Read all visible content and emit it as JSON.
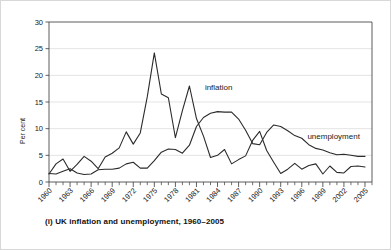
{
  "caption": "(i) UK inflation and unemployment, 1960–2005",
  "colors": {
    "line": "#2b2b2b",
    "grid": "#d9d9d9",
    "frame": "#4a4a4a",
    "text": "#1a1a1a",
    "background": "#ffffff"
  },
  "chart_data": {
    "type": "line",
    "title": "(i) UK inflation and unemployment, 1960–2005",
    "xlabel": "",
    "ylabel": "Per cent",
    "xlim": [
      1960,
      2006
    ],
    "ylim": [
      0,
      30
    ],
    "ytick_labels": [
      "0",
      "5",
      "10",
      "15",
      "20",
      "25",
      "30"
    ],
    "yticks": [
      0,
      5,
      10,
      15,
      20,
      25,
      30
    ],
    "xtick_labels": [
      "1960",
      "1963",
      "1966",
      "1969",
      "1972",
      "1975",
      "1978",
      "1981",
      "1984",
      "1987",
      "1990",
      "1993",
      "1996",
      "1999",
      "2002",
      "2005"
    ],
    "xticks": [
      1960,
      1963,
      1966,
      1969,
      1972,
      1975,
      1978,
      1981,
      1984,
      1987,
      1990,
      1993,
      1996,
      1999,
      2002,
      2005
    ],
    "xtick_minor_step": 1,
    "grid": "horizontal",
    "legend": "inline-annotations",
    "annotations": [
      {
        "text": "inflation",
        "x": 1982.2,
        "y": 17.2
      },
      {
        "text": "unemployment",
        "x": 1996.8,
        "y": 8.0
      }
    ],
    "x": [
      1960,
      1961,
      1962,
      1963,
      1964,
      1965,
      1966,
      1967,
      1968,
      1969,
      1970,
      1971,
      1972,
      1973,
      1974,
      1975,
      1976,
      1977,
      1978,
      1979,
      1980,
      1981,
      1982,
      1983,
      1984,
      1985,
      1986,
      1987,
      1988,
      1989,
      1990,
      1991,
      1992,
      1993,
      1994,
      1995,
      1996,
      1997,
      1998,
      1999,
      2000,
      2001,
      2002,
      2003,
      2004,
      2005
    ],
    "series": [
      {
        "name": "inflation",
        "values": [
          1.5,
          3.4,
          4.3,
          2.0,
          3.3,
          4.8,
          3.9,
          2.5,
          4.7,
          5.4,
          6.4,
          9.4,
          7.1,
          9.2,
          16.0,
          24.2,
          16.5,
          15.8,
          8.3,
          13.4,
          18.0,
          11.9,
          8.6,
          4.6,
          5.0,
          6.1,
          3.4,
          4.2,
          4.9,
          7.8,
          9.5,
          5.9,
          3.7,
          1.6,
          2.4,
          3.5,
          2.4,
          3.1,
          3.4,
          1.5,
          3.0,
          1.8,
          1.7,
          2.9,
          3.0,
          2.8
        ],
        "color": "#2b2b2b"
      },
      {
        "name": "unemployment",
        "values": [
          1.6,
          1.5,
          2.0,
          2.5,
          1.7,
          1.4,
          1.5,
          2.3,
          2.4,
          2.4,
          2.6,
          3.4,
          3.7,
          2.6,
          2.6,
          4.0,
          5.6,
          6.2,
          6.1,
          5.4,
          6.9,
          10.4,
          12.1,
          12.9,
          13.2,
          13.1,
          13.1,
          11.8,
          9.7,
          7.2,
          7.0,
          9.3,
          10.7,
          10.4,
          9.6,
          8.7,
          8.2,
          7.0,
          6.3,
          6.0,
          5.5,
          5.1,
          5.2,
          5.0,
          4.8,
          4.8
        ],
        "color": "#2b2b2b"
      }
    ]
  },
  "labels": {
    "y_axis_title": "Per cent",
    "inflation": "inflation",
    "unemployment": "unemployment"
  }
}
